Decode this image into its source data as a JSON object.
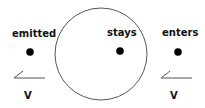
{
  "diagram": {
    "labels": {
      "emitted": "emitted",
      "stays": "stays",
      "enters": "enters",
      "velocity_left": "V",
      "velocity_right": "V"
    },
    "colors": {
      "stroke": "#555555",
      "dot": "#000000",
      "text": "#111111",
      "background": "#ffffff"
    },
    "circle": {
      "cx": 101,
      "cy": 54,
      "r": 46
    },
    "dots": [
      {
        "name": "emitted",
        "cx": 30,
        "cy": 52
      },
      {
        "name": "stays",
        "cx": 120,
        "cy": 51
      },
      {
        "name": "enters",
        "cx": 178,
        "cy": 52
      }
    ]
  }
}
